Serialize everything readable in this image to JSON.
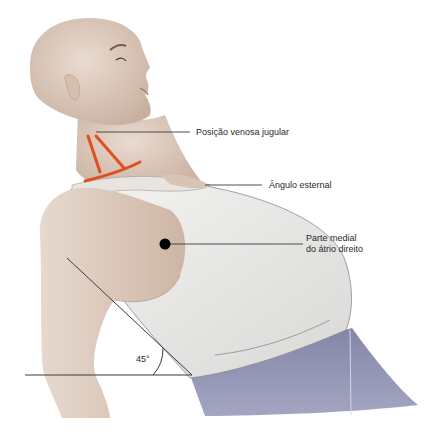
{
  "figure": {
    "labels": {
      "jugular": "Posição venosa jugular",
      "sternal_angle": "Ângulo esternal",
      "right_atrium_line1": "Parte medial",
      "right_atrium_line2": "do átrio direito",
      "angle": "45°"
    },
    "colors": {
      "skin": "#ddcbbd",
      "skin_shadow": "#c9b2a0",
      "shirt": "#ecebea",
      "pants": "#8f90b0",
      "jugular_marker": "#e0501e",
      "leader_line": "#3a3a3a",
      "dot": "#000000"
    }
  }
}
